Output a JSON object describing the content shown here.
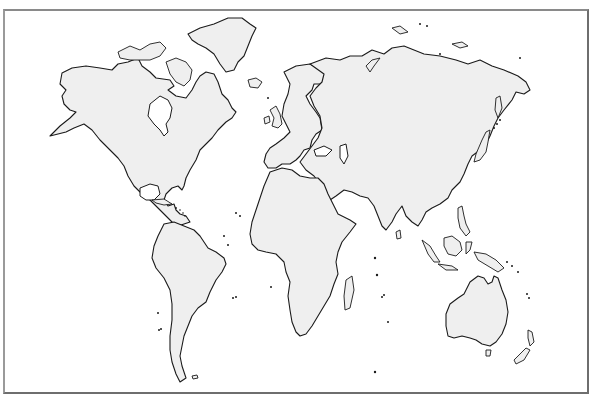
{
  "map": {
    "type": "world-outline",
    "projection": "blank political outline (no labels)",
    "colors": {
      "land_fill": "#efefef",
      "coastline": "#1a1a1a",
      "ocean": "#ffffff",
      "frame": "#6e6e6e"
    },
    "regions": [
      {
        "id": "north-america",
        "label": ""
      },
      {
        "id": "greenland",
        "label": ""
      },
      {
        "id": "south-america",
        "label": ""
      },
      {
        "id": "europe",
        "label": ""
      },
      {
        "id": "africa",
        "label": ""
      },
      {
        "id": "asia",
        "label": ""
      },
      {
        "id": "australia",
        "label": ""
      },
      {
        "id": "new-zealand",
        "label": ""
      },
      {
        "id": "madagascar",
        "label": ""
      },
      {
        "id": "japan",
        "label": ""
      },
      {
        "id": "indonesia",
        "label": ""
      },
      {
        "id": "new-guinea",
        "label": ""
      },
      {
        "id": "british-isles",
        "label": ""
      },
      {
        "id": "iceland",
        "label": ""
      },
      {
        "id": "sri-lanka",
        "label": ""
      },
      {
        "id": "philippines",
        "label": ""
      },
      {
        "id": "caribbean",
        "label": ""
      },
      {
        "id": "tasmania",
        "label": ""
      }
    ]
  }
}
